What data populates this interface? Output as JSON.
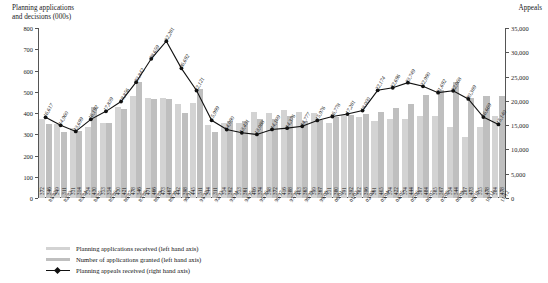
{
  "titles": {
    "left_axis": "Planning applications\nand decisions (000s)",
    "right_axis": "Appeals"
  },
  "legend": {
    "items": [
      {
        "key": "received",
        "label": "Planning applications received (left hand axis)",
        "color": "#d3d3d3",
        "type": "bar"
      },
      {
        "key": "granted",
        "label": "Number of applications granted (left hand axis)",
        "color": "#bfbfbf",
        "type": "bar"
      },
      {
        "key": "appeals",
        "label": "Planning appeals received (right hand axis)",
        "color": "#111111",
        "type": "line"
      }
    ]
  },
  "chart_data": {
    "type": "bar",
    "title": "",
    "xlabel": "",
    "ylabel": "Planning applications and decisions (000s)",
    "y2label": "Appeals",
    "ylim": [
      0,
      800
    ],
    "y2lim": [
      0,
      35000
    ],
    "yticks": [
      "0",
      "100",
      "200",
      "300",
      "400",
      "500",
      "600",
      "700",
      "800"
    ],
    "y2ticks": [
      "0",
      "5,000",
      "10,000",
      "15,000",
      "20,000",
      "25,000",
      "30,000",
      "35,000"
    ],
    "grid": false,
    "legend_position": "bottom-left",
    "categories": [
      "81/82",
      "82/83",
      "83/84",
      "84/85",
      "85/86",
      "86/87",
      "87/88",
      "88/89",
      "89/90",
      "90/91",
      "91/92",
      "92/93",
      "93/94",
      "94/95",
      "95/96",
      "96/97",
      "97/98",
      "98/99",
      "99/00",
      "00/01",
      "01/02",
      "02/03",
      "03/04",
      "04/05",
      "05/06",
      "06/07",
      "07/08",
      "08/09",
      "09/10",
      "10/11",
      "11/12"
    ],
    "series": [
      {
        "name": "Planning applications received (left hand axis)",
        "axis": "left",
        "type": "bar",
        "color": "#d3d3d3",
        "values": [
          372,
          349,
          331,
          334,
          353,
          430,
          478,
          471,
          473,
          442,
          445,
          344,
          354,
          353,
          406,
          398,
          416,
          403,
          399,
          351,
          391,
          382,
          361,
          374,
          374,
          387,
          385,
          334,
          287,
          335,
          384
        ]
      },
      {
        "name": "Number of applications granted (left hand axis)",
        "axis": "left",
        "type": "bar",
        "color": "#bfbfbf",
        "values": [
          346,
          311,
          314,
          430,
          354,
          421,
          546,
          466,
          467,
          398,
          511,
          311,
          362,
          361,
          374,
          372,
          388,
          363,
          367,
          380,
          392,
          396,
          405,
          422,
          444,
          484,
          507,
          544,
          473,
          478,
          478
        ]
      },
      {
        "name": "Planning appeals received (right hand axis)",
        "axis": "right",
        "type": "line",
        "color": "#111111",
        "values": [
          16617,
          14960,
          13699,
          16192,
          17839,
          19856,
          23842,
          28659,
          32281,
          26692,
          22121,
          15999,
          14090,
          13431,
          13088,
          14109,
          14376,
          14777,
          15976,
          16778,
          17281,
          18000,
          22174,
          22696,
          23749,
          22990,
          21692,
          22068,
          20389,
          16669,
          15140
        ],
        "labels": [
          "16,617",
          "14,960",
          "13,699",
          "16,192",
          "17,839",
          "19,856",
          "23,842",
          "28,659",
          "32,281",
          "26,692",
          "22,121",
          "15,999",
          "14,090",
          "13,431",
          "13,088",
          "14,109",
          "14,376",
          "14,777",
          "15,976",
          "16,778",
          "17,281",
          "18,000",
          "22,174",
          "22,696",
          "23,749",
          "22,990",
          "21,692",
          "22,068",
          "20,389",
          "16,669",
          "15,140"
        ]
      }
    ]
  }
}
